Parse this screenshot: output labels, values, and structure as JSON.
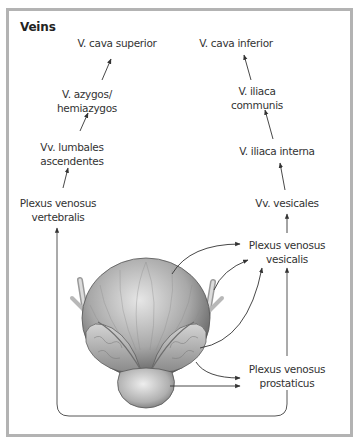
{
  "title": "Veins",
  "colors": {
    "frame_border": "#b3b3b3",
    "text": "#333333",
    "arrow": "#333333",
    "illustration_light": "#d8d8d8",
    "illustration_dark": "#6a6a6a"
  },
  "illustration": {
    "icon": "bladder-prostate-illustration",
    "subject": "Urinary bladder with seminal vesicles and prostate (posterior view)"
  },
  "nodes": {
    "cava_superior": {
      "label": "V. cava superior"
    },
    "azygos": {
      "line1": "V. azygos/",
      "line2": "hemiazygos"
    },
    "lumbales": {
      "line1": "Vv. lumbales",
      "line2": "ascendentes"
    },
    "vertebralis": {
      "line1": "Plexus venosus",
      "line2": "vertebralis"
    },
    "cava_inferior": {
      "label": "V. cava inferior"
    },
    "iliaca_communis": {
      "line1": "V. iliaca",
      "line2": "communis"
    },
    "iliaca_interna": {
      "label": "V. iliaca interna"
    },
    "vesicales": {
      "label": "Vv. vesicales"
    },
    "vesicalis": {
      "line1": "Plexus venosus",
      "line2": "vesicalis"
    },
    "prostaticus": {
      "line1": "Plexus venosus",
      "line2": "prostaticus"
    }
  },
  "edges": [
    [
      "vertebralis",
      "lumbales"
    ],
    [
      "lumbales",
      "azygos"
    ],
    [
      "azygos",
      "cava_superior"
    ],
    [
      "vesicalis",
      "vesicales"
    ],
    [
      "vesicales",
      "iliaca_interna"
    ],
    [
      "iliaca_interna",
      "iliaca_communis"
    ],
    [
      "iliaca_communis",
      "cava_inferior"
    ],
    [
      "bladder",
      "vesicalis"
    ],
    [
      "prostate",
      "prostaticus"
    ],
    [
      "prostaticus",
      "vesicalis"
    ],
    [
      "prostaticus",
      "vertebralis"
    ]
  ]
}
